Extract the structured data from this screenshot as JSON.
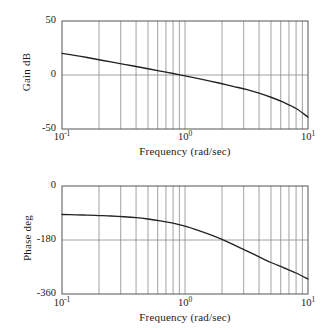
{
  "figure": {
    "background": "#ffffff",
    "curve_color": "#222222",
    "axis_color": "#555555",
    "grid_color": "#8a8a8a"
  },
  "chart_data": [
    {
      "type": "line",
      "title": "",
      "panel": "magnitude",
      "xlabel": "Frequency (rad/sec)",
      "ylabel": "Gain dB",
      "xscale": "log",
      "xlim": [
        0.1,
        10
      ],
      "ylim": [
        -50,
        50
      ],
      "xticks": [
        0.1,
        1,
        10
      ],
      "xticklabels": [
        "10-1",
        "100",
        "101"
      ],
      "xtick_bases": [
        "10",
        "10",
        "10"
      ],
      "xtick_exponents": [
        "-1",
        "0",
        "1"
      ],
      "yticks": [
        50,
        0,
        -50
      ],
      "yticklabels": [
        "50",
        "0",
        "-50"
      ],
      "grid": true,
      "grid_minor_log": true,
      "legend": "none",
      "x": [
        0.1,
        0.13,
        0.16,
        0.2,
        0.25,
        0.32,
        0.4,
        0.5,
        0.63,
        0.8,
        1.0,
        1.26,
        1.6,
        2.0,
        2.5,
        3.2,
        4.0,
        5.0,
        6.3,
        8.0,
        10.0
      ],
      "values": [
        20.0,
        18.0,
        16.2,
        14.1,
        12.1,
        9.9,
        7.9,
        5.8,
        3.6,
        1.4,
        -0.8,
        -3.1,
        -5.6,
        -8.1,
        -10.7,
        -13.6,
        -16.8,
        -20.6,
        -25.2,
        -31.0,
        -39.0
      ]
    },
    {
      "type": "line",
      "title": "",
      "panel": "phase",
      "xlabel": "Frequency (rad/sec)",
      "ylabel": "Phase deg",
      "xscale": "log",
      "xlim": [
        0.1,
        10
      ],
      "ylim": [
        -360,
        0
      ],
      "xticks": [
        0.1,
        1,
        10
      ],
      "xticklabels": [
        "10-1",
        "100",
        "101"
      ],
      "xtick_bases": [
        "10",
        "10",
        "10"
      ],
      "xtick_exponents": [
        "-1",
        "0",
        "1"
      ],
      "yticks": [
        0,
        -180,
        -360
      ],
      "yticklabels": [
        "0",
        "-180",
        "-360"
      ],
      "grid": true,
      "grid_minor_log": true,
      "legend": "none",
      "x": [
        0.1,
        0.13,
        0.16,
        0.2,
        0.25,
        0.32,
        0.4,
        0.5,
        0.63,
        0.8,
        1.0,
        1.26,
        1.6,
        2.0,
        2.5,
        3.2,
        4.0,
        5.0,
        6.3,
        8.0,
        10.0
      ],
      "values": [
        -95.0,
        -96.0,
        -97.0,
        -98.5,
        -100.0,
        -102.5,
        -105.5,
        -110.0,
        -116.0,
        -124.0,
        -134.0,
        -147.0,
        -162.0,
        -178.0,
        -196.0,
        -217.0,
        -236.0,
        -255.0,
        -272.0,
        -290.0,
        -310.0
      ]
    }
  ],
  "gain_panel": {
    "ylabel": "Gain dB",
    "xlabel": "Frequency (rad/sec)",
    "yticks": [
      {
        "label": "50"
      },
      {
        "label": "0"
      },
      {
        "label": "-50"
      }
    ],
    "xticks": [
      {
        "base": "10",
        "exp": "-1"
      },
      {
        "base": "10",
        "exp": "0"
      },
      {
        "base": "10",
        "exp": "1"
      }
    ]
  },
  "phase_panel": {
    "ylabel": "Phase deg",
    "xlabel": "Frequency (rad/sec)",
    "yticks": [
      {
        "label": "0"
      },
      {
        "label": "-180"
      },
      {
        "label": "-360"
      }
    ],
    "xticks": [
      {
        "base": "10",
        "exp": "-1"
      },
      {
        "base": "10",
        "exp": "0"
      },
      {
        "base": "10",
        "exp": "1"
      }
    ]
  }
}
